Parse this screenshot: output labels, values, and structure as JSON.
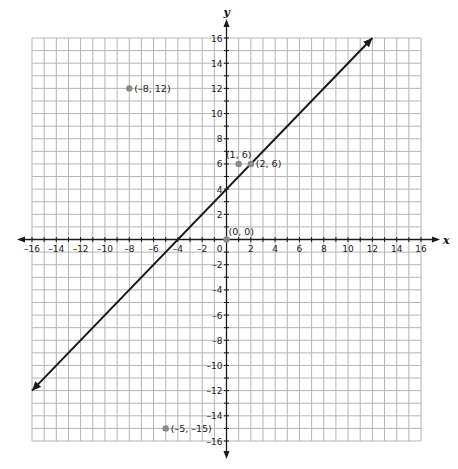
{
  "chart_data": {
    "type": "line",
    "title": "",
    "xlabel": "x",
    "ylabel": "y",
    "xlim": [
      -16,
      16
    ],
    "ylim": [
      -16,
      16
    ],
    "grid": true,
    "grid_step": 1,
    "x_ticks": [
      -16,
      -14,
      -12,
      -10,
      -8,
      -6,
      -4,
      -2,
      0,
      2,
      4,
      6,
      8,
      10,
      12,
      14,
      16
    ],
    "y_ticks": [
      -16,
      -14,
      -12,
      -10,
      -8,
      -6,
      -4,
      -2,
      2,
      4,
      6,
      8,
      10,
      12,
      14,
      16
    ],
    "origin_label": "0",
    "series": [
      {
        "name": "line y = x + 4",
        "type": "line",
        "x": [
          -16,
          12
        ],
        "y": [
          -12,
          16
        ],
        "arrows": "both",
        "color": "#1a1a1a"
      }
    ],
    "points": [
      {
        "x": -8,
        "y": 12,
        "label": "(–8, 12)",
        "label_pos": "right"
      },
      {
        "x": 1,
        "y": 6,
        "label": "(1, 6)",
        "label_pos": "above"
      },
      {
        "x": 2,
        "y": 6,
        "label": "(2, 6)",
        "label_pos": "right"
      },
      {
        "x": 0,
        "y": 0,
        "label": "(0, 0)",
        "label_pos": "above-right"
      },
      {
        "x": -5,
        "y": -15,
        "label": "(–5, –15)",
        "label_pos": "right"
      }
    ],
    "colors": {
      "grid": "#b5b5b5",
      "axis": "#1a1a1a",
      "point": "#8a8a8a",
      "line": "#1a1a1a"
    }
  }
}
